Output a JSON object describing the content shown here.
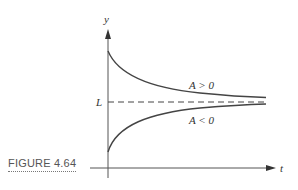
{
  "figure": {
    "caption": "FIGURE 4.64"
  },
  "axes": {
    "y_label": "y",
    "x_label": "t",
    "equilibrium_label": "L"
  },
  "curves": [
    {
      "label": "A > 0",
      "description": "decreasing toward L from above"
    },
    {
      "label": "A < 0",
      "description": "increasing toward L from below"
    }
  ],
  "colors": {
    "line": "#444444",
    "text": "#333333"
  }
}
